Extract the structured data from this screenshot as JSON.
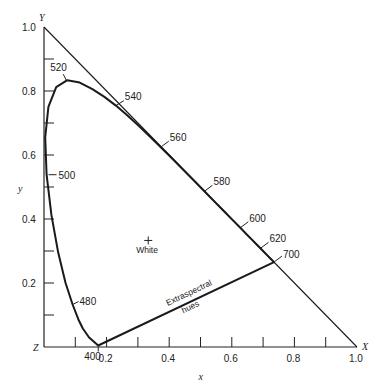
{
  "page": {
    "title_cut": "Chromaticity diagram (cropped)"
  },
  "chart_data": {
    "type": "line",
    "title": "",
    "xlabel": "x",
    "ylabel": "y",
    "xlim": [
      0,
      1.0
    ],
    "ylim": [
      0,
      1.0
    ],
    "grid": false,
    "legend": null,
    "axis_corner_labels": {
      "origin": "Z",
      "x_end": "X",
      "y_end": "Y"
    },
    "x_ticks": [
      0.1,
      0.2,
      0.3,
      0.4,
      0.5,
      0.6,
      0.7,
      0.8,
      0.9,
      1.0
    ],
    "x_tick_labels": [
      {
        "value": 0.2,
        "label": "0.2"
      },
      {
        "value": 0.4,
        "label": "0.4"
      },
      {
        "value": 0.6,
        "label": "0.6"
      },
      {
        "value": 0.8,
        "label": "0.8"
      },
      {
        "value": 1.0,
        "label": "1.0"
      }
    ],
    "y_ticks": [
      0.1,
      0.2,
      0.3,
      0.4,
      0.5,
      0.6,
      0.7,
      0.8,
      0.9,
      1.0
    ],
    "y_tick_labels": [
      {
        "value": 0.2,
        "label": "0.2"
      },
      {
        "value": 0.4,
        "label": "0.4"
      },
      {
        "value": 0.6,
        "label": "0.6"
      },
      {
        "value": 0.8,
        "label": "0.8"
      },
      {
        "value": 1.0,
        "label": "1.0"
      }
    ],
    "series": [
      {
        "name": "Spectral locus",
        "points": [
          [
            0.1733,
            0.0048
          ],
          [
            0.144,
            0.0297
          ],
          [
            0.1241,
            0.0578
          ],
          [
            0.1096,
            0.0868
          ],
          [
            0.0913,
            0.1327
          ],
          [
            0.0687,
            0.2007
          ],
          [
            0.0454,
            0.295
          ],
          [
            0.0235,
            0.4127
          ],
          [
            0.0082,
            0.5384
          ],
          [
            0.0039,
            0.6548
          ],
          [
            0.0139,
            0.7502
          ],
          [
            0.0389,
            0.812
          ],
          [
            0.0743,
            0.8338
          ],
          [
            0.1142,
            0.8262
          ],
          [
            0.1547,
            0.8059
          ],
          [
            0.1929,
            0.7816
          ],
          [
            0.2296,
            0.7543
          ],
          [
            0.2658,
            0.7243
          ],
          [
            0.3016,
            0.6923
          ],
          [
            0.3373,
            0.6589
          ],
          [
            0.3731,
            0.6245
          ],
          [
            0.4087,
            0.5896
          ],
          [
            0.4441,
            0.5547
          ],
          [
            0.4788,
            0.5202
          ],
          [
            0.5125,
            0.4866
          ],
          [
            0.5448,
            0.4544
          ],
          [
            0.5752,
            0.4242
          ],
          [
            0.6029,
            0.3965
          ],
          [
            0.627,
            0.3725
          ],
          [
            0.6482,
            0.3514
          ],
          [
            0.6658,
            0.334
          ],
          [
            0.6801,
            0.3197
          ],
          [
            0.6915,
            0.3083
          ],
          [
            0.7079,
            0.292
          ],
          [
            0.719,
            0.2809
          ],
          [
            0.726,
            0.274
          ],
          [
            0.7347,
            0.2653
          ]
        ]
      },
      {
        "name": "Extraspectral hues (purple line)",
        "points": [
          [
            0.1733,
            0.0048
          ],
          [
            0.7347,
            0.2653
          ]
        ]
      },
      {
        "name": "Triangle hypotenuse",
        "points": [
          [
            0.0,
            1.0
          ],
          [
            1.0,
            0.0
          ]
        ]
      }
    ],
    "wavelength_labels": [
      {
        "nm": "400",
        "x": 0.1733,
        "y": 0.0048
      },
      {
        "nm": "480",
        "x": 0.0913,
        "y": 0.1327
      },
      {
        "nm": "500",
        "x": 0.0082,
        "y": 0.5384
      },
      {
        "nm": "520",
        "x": 0.0743,
        "y": 0.8338
      },
      {
        "nm": "540",
        "x": 0.2296,
        "y": 0.7543
      },
      {
        "nm": "560",
        "x": 0.3731,
        "y": 0.6245
      },
      {
        "nm": "580",
        "x": 0.5125,
        "y": 0.4866
      },
      {
        "nm": "600",
        "x": 0.627,
        "y": 0.3725
      },
      {
        "nm": "620",
        "x": 0.6915,
        "y": 0.3083
      },
      {
        "nm": "700",
        "x": 0.7347,
        "y": 0.2653
      }
    ],
    "annotations": [
      {
        "text": "White",
        "x": 0.333,
        "y": 0.333,
        "marker": "+"
      },
      {
        "text": "Extraspectral",
        "line2": "hues",
        "along": "purple line"
      }
    ]
  }
}
